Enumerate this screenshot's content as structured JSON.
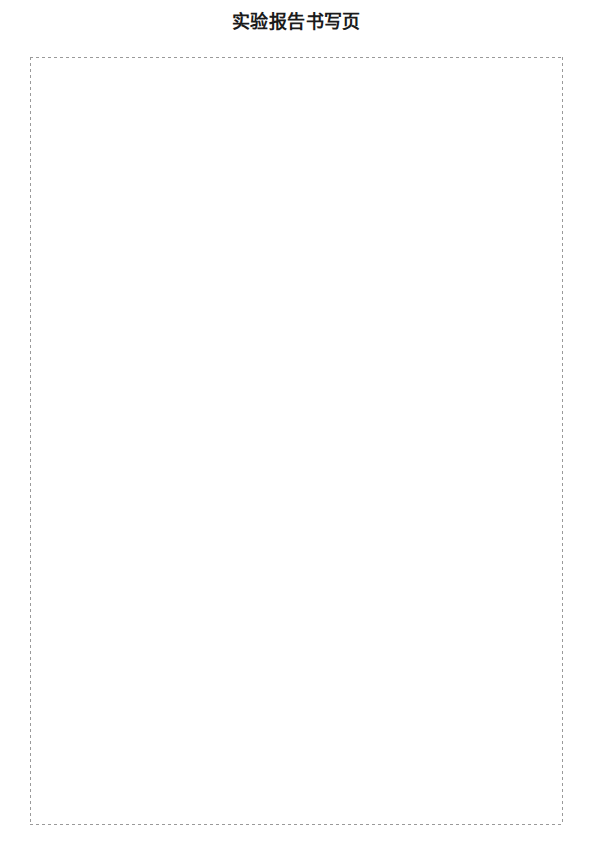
{
  "document": {
    "title": "实验报告书写页",
    "page_background": "#ffffff"
  },
  "frame": {
    "border_style": "dashed",
    "border_color": "#9a9a9a",
    "border_width_px": 1,
    "content": ""
  }
}
